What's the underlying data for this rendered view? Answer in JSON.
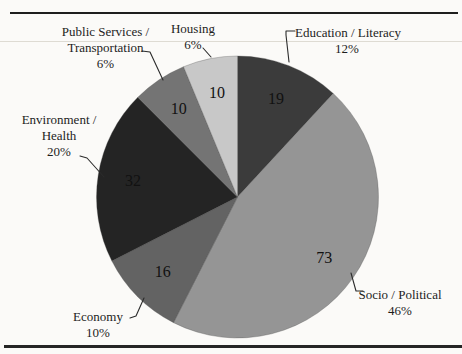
{
  "page": {
    "background": "#fbfaf8",
    "top_rule_color": "#1e1e1e",
    "bottom_rule_color": "#252525"
  },
  "chart_data": {
    "type": "pie",
    "title": "",
    "legend": "none",
    "direction": "clockwise",
    "start_angle": "12 o'clock",
    "total": 160,
    "data_labels": "raw values inside slices; category name + percent as outside callouts with leader lines",
    "slices": [
      {
        "key": "education_literacy",
        "label": "Education / Literacy",
        "label_lines": [
          "Education / Literacy"
        ],
        "value": 19,
        "percent": 12,
        "pct_label": "12%",
        "color": "#3b3b3b"
      },
      {
        "key": "socio_political",
        "label": "Socio / Political",
        "label_lines": [
          "Socio / Political"
        ],
        "value": 73,
        "percent": 46,
        "pct_label": "46%",
        "color": "#959595"
      },
      {
        "key": "economy",
        "label": "Economy",
        "label_lines": [
          "Economy"
        ],
        "value": 16,
        "percent": 10,
        "pct_label": "10%",
        "color": "#636363"
      },
      {
        "key": "environment_health",
        "label": "Environment / Health",
        "label_lines": [
          "Environment /",
          "Health"
        ],
        "value": 32,
        "percent": 20,
        "pct_label": "20%",
        "color": "#242424"
      },
      {
        "key": "public_services_transportation",
        "label": "Public Services / Transportation",
        "label_lines": [
          "Public Services /",
          "Transportation"
        ],
        "value": 10,
        "percent": 6,
        "pct_label": "6%",
        "color": "#747474"
      },
      {
        "key": "housing",
        "label": "Housing",
        "label_lines": [
          "Housing"
        ],
        "value": 10,
        "percent": 6,
        "pct_label": "6%",
        "color": "#c8c8c8"
      }
    ]
  }
}
